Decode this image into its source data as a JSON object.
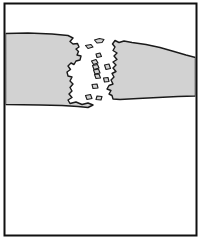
{
  "figure": {
    "type": "line-drawing",
    "caption": "",
    "canvas": {
      "width": 205,
      "height": 243
    },
    "colors": {
      "background": "#ffffff",
      "band_fill": "#d2d2d2",
      "outline": "#1a1a1a",
      "frame": "#101010"
    },
    "frame": {
      "name": "figure-border",
      "x": 4.5,
      "y": 3.5,
      "width": 192,
      "height": 232,
      "stroke_width": 2.0
    },
    "bands": [
      {
        "name": "left-band",
        "label": "Left band segment",
        "outline_width": 1.4,
        "path": "M 5.5,33.5 L 28,33.0 L 52,34.0 L 68,35.5 L 73,38.0 L 70,41.5 L 73,44.0 L 77.5,43.5 L 79,47.0 L 76,49.0 L 78.5,51.5 L 77,55.0 L 81,56.0 L 80,60.0 L 76,61.0 L 74,64.5 L 71,63.0 L 68,66.0 L 70.5,69.5 L 67,72.0 L 68,76.0 L 72,77.0 L 70,81.0 L 73,84.0 L 70,87.5 L 72,91.0 L 69,94.0 L 72,97.5 L 68,100.0 L 70,103.5 L 76,102.0 L 82,104.5 L 88,103.0 L 93,105.0 L 88,107.5 L 78,106.5 L 62,105.5 L 40,105.0 L 5.5,104.5 Z"
      },
      {
        "name": "right-band",
        "label": "Right band segment",
        "outline_width": 1.4,
        "path": "M 112.5,44.0 L 115,40.5 L 119,42.5 L 124,41.0 L 132,42.5 L 146,44.5 L 160,47.5 L 174,51.5 L 186,55.0 L 195.5,57.5 L 195.5,96.0 L 178,96.5 L 158,97.5 L 138,98.5 L 120,99.5 L 113,99.0 L 112,95.5 L 109,94.0 L 111,90.5 L 107,89.0 L 109,85.5 L 113,84.0 L 111,80.0 L 114,77.0 L 112,73.5 L 116,71.5 L 113,68.0 L 116,65.0 L 113,62.0 L 117,59.5 L 114,56.0 L 117,53.0 L 113,50.5 L 115,47.0 Z"
      }
    ],
    "fragments": [
      {
        "name": "fragment-upper-sliver",
        "path": "M 94.5,40.0 L 99.5,38.5 L 104,39.5 L 102,42.5 L 97,43.0 Z"
      },
      {
        "name": "fragment-upper-notch",
        "path": "M 85.5,45.5 L 91,44.5 L 93,47.0 L 88,48.5 Z"
      },
      {
        "name": "fragment-mid-small-a",
        "path": "M 96.0,54.0 L 100,53.0 L 101.5,56.5 L 97,57.5 Z"
      },
      {
        "name": "fragment-chain-1",
        "path": "M 91.5,61.0 L 96,59.5 L 98,63.0 L 93.5,64.5 Z"
      },
      {
        "name": "fragment-chain-2",
        "path": "M 92.5,65.5 L 97.5,64.5 L 99,68.0 L 94,69.5 Z"
      },
      {
        "name": "fragment-chain-3",
        "path": "M 93.5,70.0 L 98.5,69.0 L 100,73.0 L 95,74.0 Z"
      },
      {
        "name": "fragment-chain-4",
        "path": "M 94.5,74.5 L 99,74.0 L 100.5,78.0 L 96,78.5 Z"
      },
      {
        "name": "fragment-right-mid",
        "path": "M 104.5,65.0 L 109,64.0 L 110.5,68.5 L 106,69.5 Z"
      },
      {
        "name": "fragment-right-low",
        "path": "M 103.5,78.0 L 108,77.5 L 109,81.5 L 104.5,82.0 Z"
      },
      {
        "name": "fragment-center-low",
        "path": "M 92.0,84.5 L 97,84.0 L 98,88.0 L 93,88.5 Z"
      },
      {
        "name": "fragment-bottom-a",
        "path": "M 85.5,95.5 L 90.5,94.5 L 92,98.5 L 87,99.5 Z"
      },
      {
        "name": "fragment-bottom-b",
        "path": "M 97.0,96.0 L 102,96.5 L 101,100.0 L 96,99.5 Z"
      }
    ]
  }
}
